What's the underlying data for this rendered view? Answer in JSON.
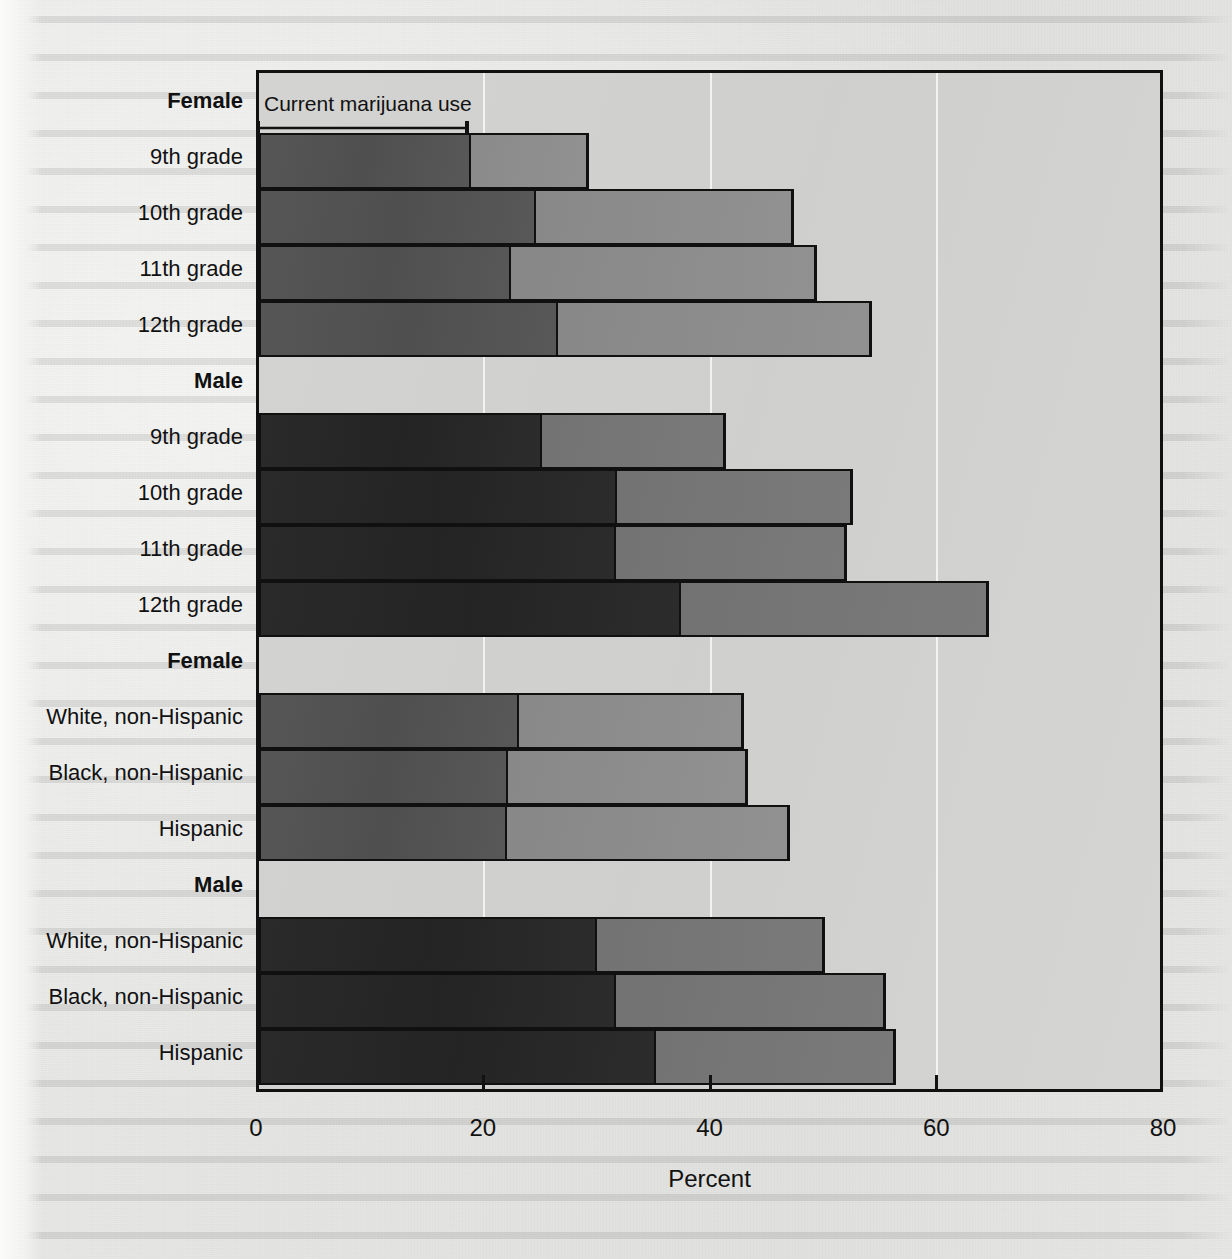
{
  "chart_data": {
    "type": "bar",
    "subtype": "stacked-horizontal",
    "title": "",
    "xlabel": "Percent",
    "ylabel": "",
    "xlim": [
      0,
      80
    ],
    "xticks": [
      0,
      20,
      40,
      60,
      80
    ],
    "xticklabels": [
      "0",
      "20",
      "40",
      "60",
      "80"
    ],
    "grid": "vertical-white-gridlines",
    "legend": "none",
    "annotation": {
      "text": "Current marijuana use",
      "arrow_from": 0,
      "arrow_to": 18.8,
      "style": "double-headed-arrow"
    },
    "series": [
      {
        "name": "Current marijuana use",
        "note": "dark inner segment"
      },
      {
        "name": "Lifetime marijuana use",
        "note": "light outer segment, cumulative total"
      }
    ],
    "groups": [
      {
        "header": "Female",
        "shade": "female",
        "rows": [
          {
            "label": "9th grade",
            "current": 18.7,
            "total": 29.1
          },
          {
            "label": "10th grade",
            "current": 24.4,
            "total": 47.2
          },
          {
            "label": "11th grade",
            "current": 22.2,
            "total": 49.2
          },
          {
            "label": "12th grade",
            "current": 26.4,
            "total": 54.1
          }
        ]
      },
      {
        "header": "Male",
        "shade": "male",
        "rows": [
          {
            "label": "9th grade",
            "current": 25.0,
            "total": 41.2
          },
          {
            "label": "10th grade",
            "current": 31.6,
            "total": 52.4
          },
          {
            "label": "11th grade",
            "current": 31.5,
            "total": 51.9
          },
          {
            "label": "12th grade",
            "current": 37.2,
            "total": 64.4
          }
        ]
      },
      {
        "header": "Female",
        "shade": "female",
        "rows": [
          {
            "label": "White, non-Hispanic",
            "current": 22.9,
            "total": 42.8
          },
          {
            "label": "Black, non-Hispanic",
            "current": 22.0,
            "total": 43.1
          },
          {
            "label": "Hispanic",
            "current": 21.9,
            "total": 46.8
          }
        ]
      },
      {
        "header": "Male",
        "shade": "male",
        "rows": [
          {
            "label": "White, non-Hispanic",
            "current": 29.8,
            "total": 49.9
          },
          {
            "label": "Black, non-Hispanic",
            "current": 31.5,
            "total": 55.3
          },
          {
            "label": "Hispanic",
            "current": 35.0,
            "total": 56.2
          }
        ]
      }
    ],
    "colors": {
      "female_current": "#545454",
      "female_total": "#8c8c8c",
      "male_current": "#282828",
      "male_total": "#757575",
      "plot_background": "#d2d2d0",
      "frame": "#111111",
      "gridline": "#ffffff"
    }
  },
  "axis": {
    "title": "Percent",
    "ticks": [
      "0",
      "20",
      "40",
      "60",
      "80"
    ]
  },
  "annotation": {
    "label": "Current marijuana use"
  }
}
